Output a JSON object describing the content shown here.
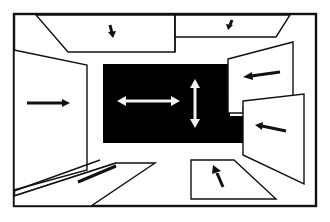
{
  "figure": {
    "colors": {
      "ink": "#111111",
      "background": "#ffffff",
      "back_wall": "#000000",
      "back_wall_arrows": "#f2f2f2"
    },
    "panels": [
      {
        "id": "ceiling-left",
        "arrow": "down"
      },
      {
        "id": "ceiling-right",
        "arrow": "down-left"
      },
      {
        "id": "left-wall",
        "arrow": "right"
      },
      {
        "id": "right-wall-upper",
        "arrow": "left"
      },
      {
        "id": "right-wall-lower",
        "arrow": "left"
      },
      {
        "id": "floor-left",
        "arrow": "up-right"
      },
      {
        "id": "floor-right",
        "arrow": "up"
      }
    ],
    "back_wall": {
      "arrows": [
        "horizontal-bidirectional",
        "vertical-bidirectional"
      ]
    }
  }
}
